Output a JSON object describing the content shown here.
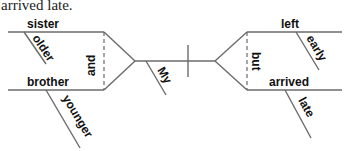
{
  "caption": "arrived late.",
  "diagram": {
    "type": "sentence-diagram",
    "subject": {
      "conjunction": "and",
      "words": [
        {
          "word": "sister",
          "modifiers": [
            "older"
          ]
        },
        {
          "word": "brother",
          "modifiers": [
            "younger"
          ]
        }
      ],
      "shared_modifier": "My"
    },
    "predicate": {
      "conjunction": "but",
      "words": [
        {
          "word": "left",
          "modifiers": [
            "early"
          ]
        },
        {
          "word": "arrived",
          "modifiers": [
            "late"
          ]
        }
      ]
    },
    "line_color": "#6b6b6b"
  }
}
